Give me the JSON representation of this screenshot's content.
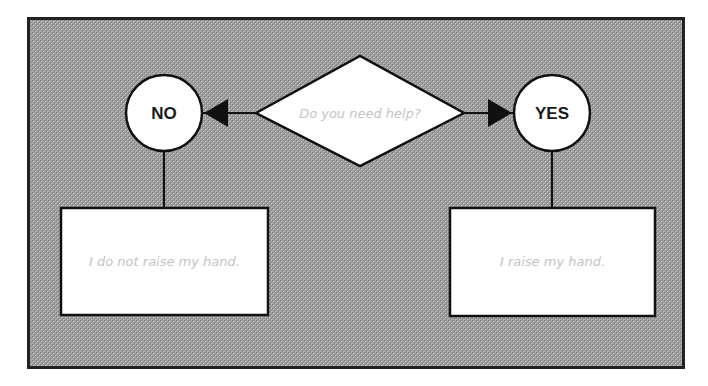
{
  "diagram": {
    "type": "flowchart",
    "background": {
      "fill": "#9a9a9a",
      "pattern": "checkered",
      "border": "#222222"
    },
    "decision": {
      "id": "decision",
      "label": "Do you need help?",
      "shape": "diamond"
    },
    "branches": [
      {
        "id": "no",
        "label": "NO",
        "shape": "circle",
        "outcome": "I do not raise my hand."
      },
      {
        "id": "yes",
        "label": "YES",
        "shape": "circle",
        "outcome": "I raise my hand."
      }
    ],
    "edges": [
      {
        "from": "decision",
        "to": "no",
        "arrow": true
      },
      {
        "from": "decision",
        "to": "yes",
        "arrow": true
      },
      {
        "from": "no",
        "to": "no-outcome",
        "arrow": false
      },
      {
        "from": "yes",
        "to": "yes-outcome",
        "arrow": false
      }
    ]
  }
}
